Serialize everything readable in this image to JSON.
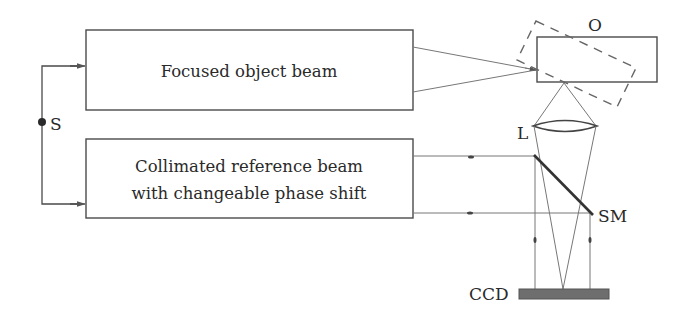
{
  "diagram": {
    "type": "optical-setup",
    "boxes": [
      {
        "id": "object-beam",
        "lines": [
          "Focused object beam"
        ]
      },
      {
        "id": "reference-beam",
        "lines": [
          "Collimated reference beam",
          "with changeable phase shift"
        ]
      }
    ],
    "labels": {
      "source": "S",
      "object": "O",
      "lens": "L",
      "mirror": "SM",
      "detector": "CCD"
    },
    "colors": {
      "stroke": "#4a4a4a",
      "beam": "#777777",
      "ccd_fill": "#6e6e6e",
      "background": "#ffffff"
    }
  }
}
